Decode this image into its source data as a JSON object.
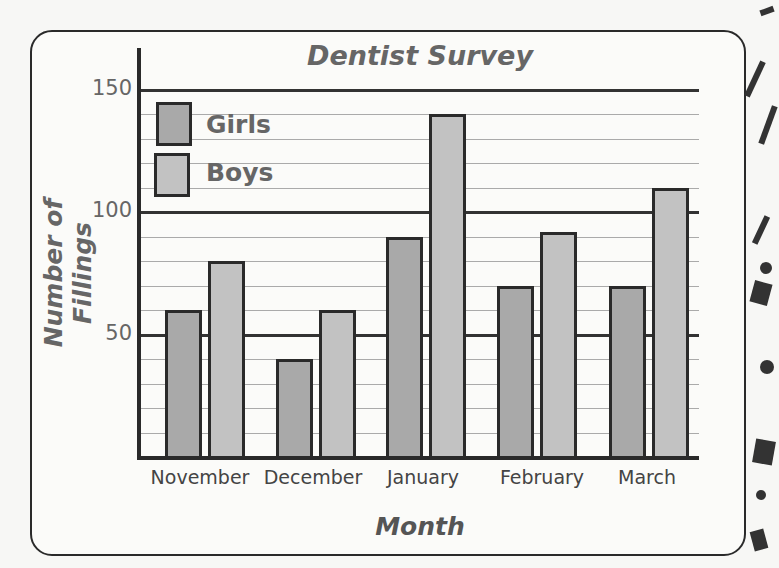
{
  "chart_data": {
    "type": "bar",
    "title": "Dentist Survey",
    "xlabel": "Month",
    "ylabel": "Number of Fillings",
    "categories": [
      "November",
      "December",
      "January",
      "February",
      "March"
    ],
    "series": [
      {
        "name": "Girls",
        "values": [
          60,
          40,
          90,
          70,
          70
        ],
        "color": "#a9a9a9"
      },
      {
        "name": "Boys",
        "values": [
          80,
          60,
          140,
          92,
          110
        ],
        "color": "#c2c2c2"
      }
    ],
    "ylim": [
      0,
      150
    ],
    "yticks": [
      50,
      100,
      150
    ],
    "minor_grid_step": 10,
    "grid": true,
    "legend_position": "top-left"
  },
  "labels": {
    "title": "Dentist Survey",
    "xlabel": "Month",
    "ylabel": "Number of Fillings",
    "yticks": [
      "150",
      "100",
      "50"
    ],
    "legend": [
      "Girls",
      "Boys"
    ],
    "categories": [
      "November",
      "December",
      "January",
      "February",
      "March"
    ]
  }
}
